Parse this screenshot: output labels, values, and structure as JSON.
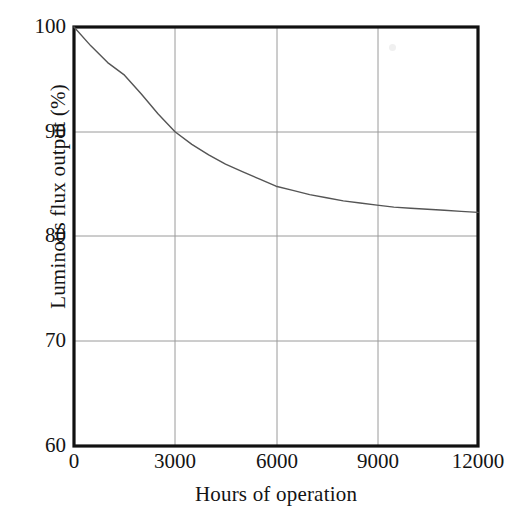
{
  "chart_data": {
    "type": "line",
    "title": "",
    "subtitle": "",
    "xlabel": "Hours of operation",
    "ylabel": "Luminous flux output (%)",
    "xlim": [
      0,
      12000
    ],
    "ylim": [
      60,
      100
    ],
    "xticks": [
      0,
      3000,
      6000,
      9000,
      12000
    ],
    "xtick_labels": [
      "0",
      "3000",
      "6000",
      "9000",
      "12000"
    ],
    "yticks": [
      60,
      70,
      80,
      90,
      100
    ],
    "ytick_labels": [
      "60",
      "70",
      "80",
      "90",
      "100"
    ],
    "grid": true,
    "grid_color": "#9a9a9a",
    "legend": null,
    "legend_position": "none",
    "frame_color": "#111111",
    "line_color": "#555555",
    "background": "#ffffff",
    "annotations": [],
    "series": [
      {
        "name": "Lumen depreciation",
        "x": [
          0,
          500,
          1000,
          1500,
          2000,
          2500,
          3000,
          3500,
          4000,
          4500,
          5000,
          5500,
          6000,
          6500,
          7000,
          7500,
          8000,
          8500,
          9000,
          9500,
          10000,
          10500,
          11000,
          11500,
          12000
        ],
        "y": [
          100.0,
          98.2,
          96.6,
          95.4,
          93.6,
          91.7,
          90.0,
          88.8,
          87.8,
          86.9,
          86.2,
          85.5,
          84.8,
          84.4,
          84.0,
          83.7,
          83.4,
          83.2,
          83.0,
          82.8,
          82.7,
          82.6,
          82.5,
          82.4,
          82.3
        ]
      }
    ]
  },
  "axes": {
    "y_title": "Luminous flux output (%)",
    "x_title": "Hours of operation",
    "y_tick_0": "100",
    "y_tick_1": "90",
    "y_tick_2": "80",
    "y_tick_3": "70",
    "y_tick_4": "60",
    "x_tick_0": "0",
    "x_tick_1": "3000",
    "x_tick_2": "6000",
    "x_tick_3": "9000",
    "x_tick_4": "12000"
  }
}
